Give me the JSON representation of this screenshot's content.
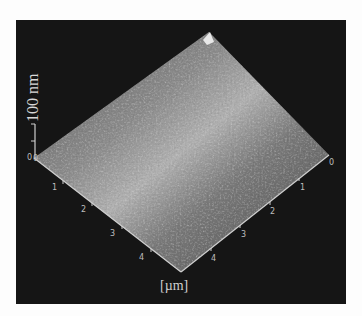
{
  "figure": {
    "type": "AFM 3D surface topography",
    "z_scale_label": "100 nm",
    "z_axis_zero": "0",
    "unit_label": "[µm]",
    "left_axis_ticks": [
      "0",
      "1",
      "2",
      "3",
      "4"
    ],
    "right_axis_ticks": [
      "0",
      "1",
      "2",
      "3",
      "4"
    ],
    "colors": {
      "background": "#151515",
      "page": "#fdfdfd",
      "surface_light": "#b8b8b8",
      "surface_dark": "#4a4a4a",
      "axis": "#cfcfcf"
    }
  }
}
